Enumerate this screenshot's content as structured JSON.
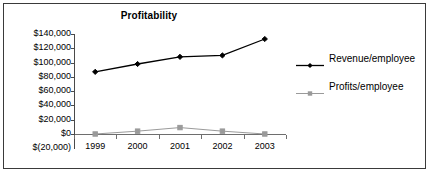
{
  "frame": {
    "border_color": "#3a3a3a",
    "background": "#ffffff"
  },
  "chart_data": {
    "type": "line",
    "title": "Profitability",
    "xlabel": "",
    "ylabel": "",
    "categories": [
      "1999",
      "2000",
      "2001",
      "2002",
      "2003"
    ],
    "series": [
      {
        "name": "Revenue/employee",
        "values": [
          87000,
          98000,
          108000,
          110000,
          133000
        ],
        "color": "#000000",
        "marker": "diamond"
      },
      {
        "name": "Profits/employee",
        "values": [
          0,
          4000,
          9000,
          4000,
          0
        ],
        "color": "#9a9a9a",
        "marker": "square"
      }
    ],
    "ylim": [
      -20000,
      140000
    ],
    "ytick_values": [
      140000,
      120000,
      100000,
      80000,
      60000,
      40000,
      20000,
      0,
      -20000
    ],
    "ytick_labels": [
      "$140,000",
      "$120,000",
      "$100,000",
      "$80,000",
      "$60,000",
      "$40,000",
      "$20,000",
      "$0",
      "$(20,000)"
    ],
    "grid": false,
    "legend_position": "right"
  }
}
